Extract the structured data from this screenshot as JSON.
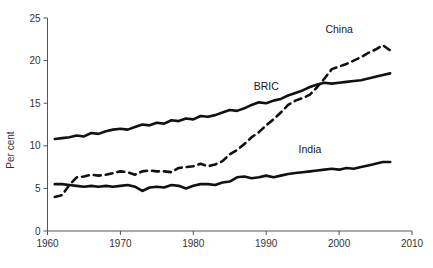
{
  "chart_data": {
    "type": "line",
    "title": "",
    "xlabel": "",
    "ylabel": "Per cent",
    "xlim": [
      1960,
      2010
    ],
    "ylim": [
      0,
      25
    ],
    "grid": false,
    "legend_position": "inline-annotations",
    "xticks": [
      "1960",
      "1970",
      "1980",
      "1990",
      "2000",
      "2010"
    ],
    "xtick_values": [
      1960,
      1970,
      1980,
      1990,
      2000,
      2010
    ],
    "yticks": [
      "0",
      "5",
      "10",
      "15",
      "20",
      "25"
    ],
    "ytick_values": [
      0,
      5,
      10,
      15,
      20,
      25
    ],
    "x": [
      1961,
      1962,
      1963,
      1964,
      1965,
      1966,
      1967,
      1968,
      1969,
      1970,
      1971,
      1972,
      1973,
      1974,
      1975,
      1976,
      1977,
      1978,
      1979,
      1980,
      1981,
      1982,
      1983,
      1984,
      1985,
      1986,
      1987,
      1988,
      1989,
      1990,
      1991,
      1992,
      1993,
      1994,
      1995,
      1996,
      1997,
      1998,
      1999,
      2000,
      2001,
      2002,
      2003,
      2004,
      2005,
      2006,
      2007
    ],
    "series": [
      {
        "name": "BRIC",
        "style": "solid",
        "color": "#111111",
        "label_x": 1990,
        "label_y": 16.6,
        "values": [
          10.8,
          10.9,
          11.0,
          11.2,
          11.1,
          11.5,
          11.4,
          11.7,
          11.9,
          12.0,
          11.9,
          12.2,
          12.5,
          12.4,
          12.7,
          12.6,
          13.0,
          12.9,
          13.2,
          13.1,
          13.5,
          13.4,
          13.6,
          13.9,
          14.2,
          14.1,
          14.4,
          14.8,
          15.1,
          15.0,
          15.3,
          15.5,
          15.9,
          16.2,
          16.5,
          16.9,
          17.2,
          17.4,
          17.3,
          17.4,
          17.5,
          17.6,
          17.7,
          17.9,
          18.1,
          18.3,
          18.5
        ]
      },
      {
        "name": "China",
        "style": "dashed",
        "color": "#111111",
        "label_x": 2000,
        "label_y": 23.2,
        "values": [
          4.0,
          4.2,
          5.4,
          6.3,
          6.4,
          6.6,
          6.5,
          6.6,
          6.8,
          7.0,
          6.9,
          6.6,
          7.0,
          7.1,
          7.0,
          7.0,
          6.9,
          7.4,
          7.5,
          7.6,
          7.9,
          7.6,
          7.8,
          8.2,
          9.0,
          9.5,
          10.2,
          11.0,
          11.6,
          12.4,
          13.1,
          13.9,
          14.8,
          15.3,
          15.6,
          16.0,
          16.9,
          17.9,
          19.0,
          19.3,
          19.6,
          20.0,
          20.4,
          20.9,
          21.3,
          21.8,
          21.2
        ]
      },
      {
        "name": "India",
        "style": "solid",
        "color": "#111111",
        "label_x": 1996,
        "label_y": 9.2,
        "values": [
          5.5,
          5.5,
          5.4,
          5.3,
          5.2,
          5.3,
          5.2,
          5.3,
          5.2,
          5.3,
          5.4,
          5.2,
          4.7,
          5.1,
          5.2,
          5.1,
          5.4,
          5.3,
          5.0,
          5.3,
          5.5,
          5.5,
          5.4,
          5.7,
          5.8,
          6.3,
          6.4,
          6.2,
          6.3,
          6.5,
          6.3,
          6.5,
          6.7,
          6.8,
          6.9,
          7.0,
          7.1,
          7.2,
          7.3,
          7.2,
          7.4,
          7.3,
          7.5,
          7.7,
          7.9,
          8.1,
          8.1
        ]
      }
    ]
  },
  "axes": {
    "ylabel": "Per cent"
  },
  "labels": {
    "bric": "BRIC",
    "china": "China",
    "india": "India"
  }
}
